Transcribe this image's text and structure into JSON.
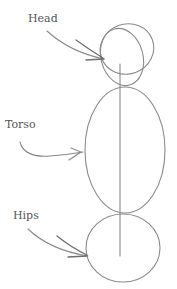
{
  "figure": {
    "labels": {
      "head": "Head",
      "torso": "Torso",
      "hips": "Hips"
    },
    "parts": [
      "head",
      "torso",
      "hips"
    ],
    "colors": {
      "background": "#ffffff",
      "stroke": "#8a8a8a",
      "text": "#555555"
    }
  }
}
